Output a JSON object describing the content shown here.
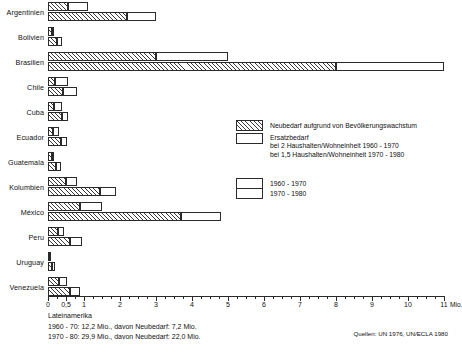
{
  "chart_data": {
    "type": "bar",
    "title": "",
    "xlabel": "Mio.",
    "ylabel": "",
    "xlim": [
      0,
      11
    ],
    "grid": false,
    "orientation": "horizontal",
    "axis_unit_label": "Mio.",
    "tick_labels": [
      "0",
      "0,5",
      "1",
      "2",
      "3",
      "4",
      "5",
      "6",
      "7",
      "8",
      "9",
      "10",
      "11"
    ],
    "tick_values": [
      0,
      0.5,
      1,
      2,
      3,
      4,
      5,
      6,
      7,
      8,
      9,
      10,
      11
    ],
    "minor_tick_step": 0.25,
    "categories": [
      "Argentinien",
      "Bolivien",
      "Brasilien",
      "Chile",
      "Cuba",
      "Ecuador",
      "Guatemala",
      "Kolumbien",
      "México",
      "Peru",
      "Uruguay",
      "Venezuela"
    ],
    "series": [
      {
        "name": "1960 - 1970",
        "stack": [
          {
            "name": "Neubedarf aufgrund von Bevölkerungswachstum",
            "values": [
              0.55,
              0.1,
              3.0,
              0.2,
              0.17,
              0.15,
              0.1,
              0.5,
              0.9,
              0.28,
              0.04,
              0.3
            ]
          },
          {
            "name": "Ersatzbedarf",
            "values": [
              0.55,
              0.05,
              2.0,
              0.35,
              0.21,
              0.15,
              0.07,
              0.3,
              0.6,
              0.17,
              0.04,
              0.22
            ]
          }
        ],
        "totals": [
          1.1,
          0.15,
          5.0,
          0.55,
          0.38,
          0.3,
          0.17,
          0.8,
          1.5,
          0.45,
          0.08,
          0.52
        ]
      },
      {
        "name": "1970 - 1980",
        "stack": [
          {
            "name": "Neubedarf aufgrund von Bevölkerungswachstum",
            "values": [
              2.2,
              0.25,
              8.0,
              0.42,
              0.4,
              0.35,
              0.22,
              1.45,
              3.7,
              0.62,
              0.11,
              0.6
            ]
          },
          {
            "name": "Ersatzbedarf",
            "values": [
              0.8,
              0.15,
              3.0,
              0.38,
              0.15,
              0.17,
              0.13,
              0.45,
              1.1,
              0.33,
              0.09,
              0.3
            ]
          }
        ],
        "totals": [
          3.0,
          0.4,
          11.0,
          0.8,
          0.55,
          0.52,
          0.35,
          1.9,
          4.8,
          0.95,
          0.2,
          0.9
        ]
      }
    ],
    "legend": {
      "position": "right",
      "entries": [
        {
          "swatch": "hatched",
          "label": "Neubedarf aufgrund von Bevölkerungswachstum"
        },
        {
          "swatch": "plain",
          "label": "Ersatzbedarf"
        }
      ],
      "sub_lines": [
        "bei 2 Haushalten/Wohneinheit 1960 - 1970",
        "bei 1,5 Haushalten/Wohneinheit 1970 - 1980"
      ],
      "period_entries": [
        {
          "swatch": "plain",
          "label": "1960 - 1970"
        },
        {
          "swatch": "plain",
          "label": "1970 - 1980"
        }
      ]
    },
    "annotations": {
      "footer_title": "Lateinamerika",
      "footer_lines": [
        "1960 - 70: 12,2 Mio., davon Neubedarf: 7,2 Mio.",
        "1970 - 80: 29,9 Mio., davon Neubedarf: 22,0 Mio."
      ],
      "source": "Quellen: UN 1976, UN/ECLA 1980"
    },
    "colors": {
      "stroke": "#2a2a2a",
      "fill_plain": "#ffffff",
      "hatch": "#3a3a3a",
      "background": "#ffffff"
    }
  }
}
